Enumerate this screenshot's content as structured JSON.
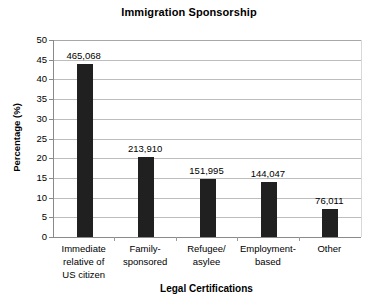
{
  "chart_data": {
    "type": "bar",
    "title": "Immigration Sponsorship",
    "xlabel": "Legal Certifications",
    "ylabel": "Percentage (%)",
    "categories": [
      "Immediate\nrelative of\nUS citizen",
      "Family-\nsponsored",
      "Refugee/\nasylee",
      "Employment-\nbased",
      "Other"
    ],
    "values": [
      44.0,
      20.2,
      14.8,
      14.0,
      7.2
    ],
    "data_labels": [
      "465,068",
      "213,910",
      "151,995",
      "144,047",
      "76,011"
    ],
    "counts": [
      465068,
      213910,
      151995,
      144047,
      76011
    ],
    "ylim": [
      0,
      50
    ],
    "yticks": [
      50,
      45,
      40,
      35,
      30,
      25,
      20,
      15,
      10,
      5,
      0
    ],
    "ytick_labels": [
      "50",
      "45",
      "40",
      "35",
      "30",
      "25",
      "20",
      "15",
      "10",
      "5",
      "0"
    ],
    "grid": true,
    "legend": false,
    "bar_color": "#202020",
    "grid_color": "#bdbdbd",
    "axis_color": "#8a8a8a",
    "background": "#ffffff"
  }
}
